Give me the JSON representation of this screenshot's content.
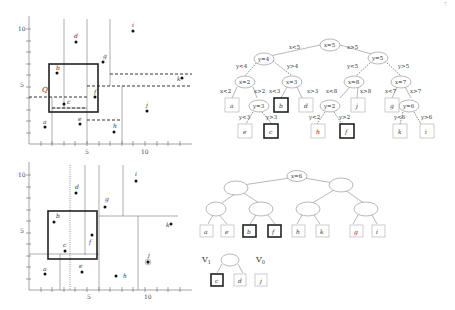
{
  "page": {
    "number": "7"
  },
  "figure_top": {
    "plot": {
      "x_ticks": [
        "5",
        "10"
      ],
      "y_ticks": [
        "10",
        "5"
      ],
      "query_label": "Q",
      "points": [
        {
          "name": "a",
          "x": 1.3,
          "y": 1.5
        },
        {
          "name": "b",
          "x": 2.4,
          "y": 6.0
        },
        {
          "name": "c",
          "x": 3.0,
          "y": 3.3
        },
        {
          "name": "d",
          "x": 4.0,
          "y": 8.8
        },
        {
          "name": "e",
          "x": 4.3,
          "y": 2.2
        },
        {
          "name": "f",
          "x": 5.7,
          "y": 4.0
        },
        {
          "name": "g",
          "x": 6.3,
          "y": 7.1
        },
        {
          "name": "h",
          "x": 7.3,
          "y": 1.0
        },
        {
          "name": "i",
          "x": 9.0,
          "y": 9.7
        },
        {
          "name": "j",
          "x": 10.1,
          "y": 2.8
        },
        {
          "name": "k",
          "x": 13.1,
          "y": 5.6
        }
      ]
    },
    "tree": {
      "nodes": [
        "x=5",
        "y=4",
        "y=5",
        "x=2",
        "x=3",
        "x=8",
        "x=7",
        "y=3",
        "y=2",
        "y=6"
      ],
      "edges": [
        "x<5",
        "x>5",
        "y<4",
        "y>4",
        "y<5",
        "y>5",
        "x<2",
        "x>2",
        "x<3",
        "x>3",
        "x<8",
        "x>8",
        "x<7",
        "x>7",
        "y<3",
        "y>3",
        "y<2",
        "y>2",
        "y<6",
        "y>6"
      ],
      "leaves": [
        "a",
        "b",
        "d",
        "j",
        "g",
        "e",
        "c",
        "h",
        "f",
        "k",
        "i"
      ]
    }
  },
  "figure_bottom": {
    "plot": {
      "x_ticks": [
        "5",
        "10"
      ],
      "y_ticks": [
        "10",
        "5"
      ],
      "points": [
        "a",
        "b",
        "c",
        "d",
        "e",
        "f",
        "g",
        "h",
        "i",
        "j",
        "k"
      ]
    },
    "tree": {
      "v3_label": "V",
      "v3_sub": "3",
      "root": "x=6",
      "leaves": [
        "a",
        "e",
        "b",
        "f",
        "h",
        "k",
        "g",
        "i"
      ],
      "v1_label": "V",
      "v1_sub": "1",
      "v0_label": "V",
      "v0_sub": "0",
      "v1_leaves": [
        "c",
        "d"
      ],
      "v0_leaves": [
        "j"
      ]
    }
  }
}
